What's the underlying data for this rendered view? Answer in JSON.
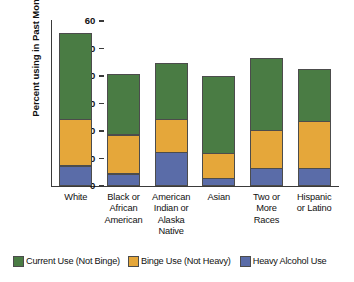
{
  "chart_data": {
    "type": "bar",
    "stacked": true,
    "title": "",
    "subtitle": "",
    "xlabel": "",
    "ylabel": "Percent using in Past Month",
    "ylim": [
      0,
      60
    ],
    "yticks": [
      0,
      10,
      20,
      30,
      40,
      50,
      60
    ],
    "ytick_labels": [
      "0",
      "10",
      "20",
      "30",
      "40",
      "50",
      "60"
    ],
    "grid": false,
    "legend_position": "bottom",
    "categories": [
      "White",
      "Black or African American",
      "American Indian or Alaska Native",
      "Asian",
      "Two or More Races",
      "Hispanic or Latino"
    ],
    "category_label_lines": [
      [
        "White"
      ],
      [
        "Black or",
        "African",
        "American"
      ],
      [
        "American",
        "Indian or",
        "Alaska",
        "Native"
      ],
      [
        "Asian"
      ],
      [
        "Two or",
        "More",
        "Races"
      ],
      [
        "Hispanic",
        "or Latino"
      ]
    ],
    "series": [
      {
        "name": "Heavy Alcohol Use",
        "color": "#5a6ca8",
        "values": [
          7.4,
          4.5,
          12.3,
          2.8,
          6.5,
          6.6
        ]
      },
      {
        "name": "Binge Use (Not Heavy)",
        "color": "#e5a73a",
        "values": [
          17.3,
          14.5,
          12.4,
          9.5,
          14.1,
          17.4
        ]
      },
      {
        "name": "Current Use (Not Binge)",
        "color": "#4a7c44",
        "values": [
          31.7,
          22.4,
          20.6,
          28.4,
          26.7,
          19.3
        ]
      }
    ],
    "stack_tops": [
      56.4,
      41.4,
      45.3,
      40.7,
      47.3,
      43.3
    ],
    "legend_entries": [
      {
        "label": "Current Use (Not Binge)",
        "color": "#4a7c44"
      },
      {
        "label": "Binge Use (Not Heavy)",
        "color": "#e5a73a"
      },
      {
        "label": "Heavy Alcohol Use",
        "color": "#5a6ca8"
      }
    ]
  }
}
